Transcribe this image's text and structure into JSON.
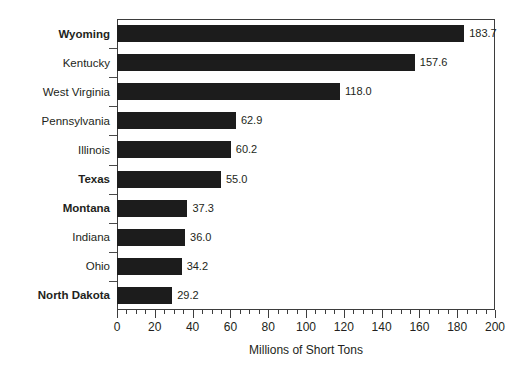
{
  "chart_data": {
    "type": "bar",
    "orientation": "horizontal",
    "title": "",
    "subtitle": "",
    "xlabel": "Millions of Short Tons",
    "ylabel": "",
    "xlim": [
      0,
      200
    ],
    "xticks": [
      0,
      20,
      40,
      60,
      80,
      100,
      120,
      140,
      160,
      180,
      200
    ],
    "xtick_labels": [
      "0",
      "20",
      "40",
      "60",
      "80",
      "100",
      "120",
      "140",
      "160",
      "180",
      "200"
    ],
    "minor_tick_interval": 5,
    "grid": false,
    "legend": null,
    "bar_color": "#1c1c1c",
    "categories": [
      "Wyoming",
      "Kentucky",
      "West Virginia",
      "Pennsylvania",
      "Illinois",
      "Texas",
      "Montana",
      "Indiana",
      "Ohio",
      "North Dakota"
    ],
    "values": [
      183.7,
      157.6,
      118.0,
      62.9,
      60.2,
      55.0,
      37.3,
      36.0,
      34.2,
      29.2
    ],
    "data_labels": [
      "183.7",
      "157.6",
      "118.0",
      "62.9",
      "60.2",
      "55.0",
      "37.3",
      "36.0",
      "34.2",
      "29.2"
    ],
    "bold_categories": [
      "Wyoming",
      "Texas",
      "Montana",
      "North Dakota"
    ],
    "bars": [
      {
        "category": "Wyoming",
        "value": 183.7,
        "label": "183.7",
        "bold": true
      },
      {
        "category": "Kentucky",
        "value": 157.6,
        "label": "157.6",
        "bold": false
      },
      {
        "category": "West Virginia",
        "value": 118.0,
        "label": "118.0",
        "bold": false
      },
      {
        "category": "Pennsylvania",
        "value": 62.9,
        "label": "62.9",
        "bold": false
      },
      {
        "category": "Illinois",
        "value": 60.2,
        "label": "60.2",
        "bold": false
      },
      {
        "category": "Texas",
        "value": 55.0,
        "label": "55.0",
        "bold": true
      },
      {
        "category": "Montana",
        "value": 37.3,
        "label": "37.3",
        "bold": true
      },
      {
        "category": "Indiana",
        "value": 36.0,
        "label": "36.0",
        "bold": false
      },
      {
        "category": "Ohio",
        "value": 34.2,
        "label": "34.2",
        "bold": false
      },
      {
        "category": "North Dakota",
        "value": 29.2,
        "label": "29.2",
        "bold": true
      }
    ]
  }
}
